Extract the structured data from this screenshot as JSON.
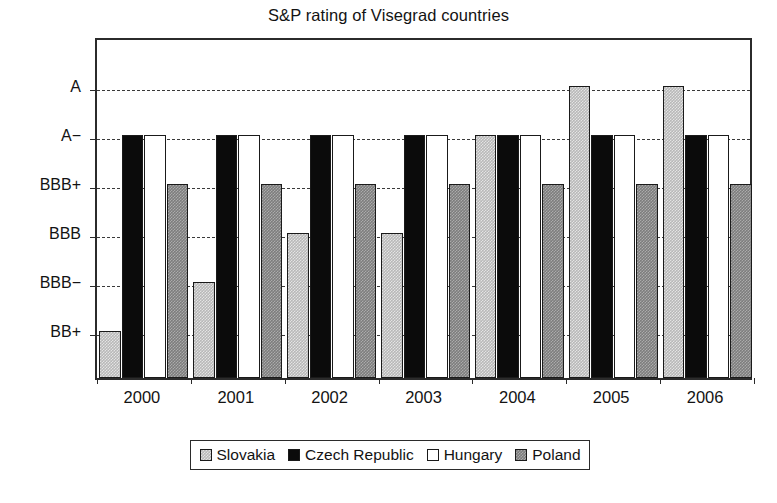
{
  "chart_data": {
    "type": "bar",
    "title": "S&P rating of Visegrad countries",
    "xlabel": "",
    "ylabel": "",
    "grid": true,
    "legend_position": "bottom",
    "categories": [
      "2000",
      "2001",
      "2002",
      "2003",
      "2004",
      "2005",
      "2006"
    ],
    "y_tick_labels": [
      "A",
      "A−",
      "BBB+",
      "BBB",
      "BBB−",
      "BB+"
    ],
    "y_scale_ordinal": [
      "BB+",
      "BBB−",
      "BBB",
      "BBB+",
      "A−",
      "A"
    ],
    "ylim": [
      0,
      6
    ],
    "series": [
      {
        "name": "Slovakia",
        "color": "#b8b8b8",
        "ratings": [
          "BB+",
          "BBB−",
          "BBB",
          "BBB",
          "A−",
          "A",
          "A"
        ],
        "values": [
          1,
          2,
          3,
          3,
          5,
          6,
          6
        ]
      },
      {
        "name": "Czech Republic",
        "color": "#0b0b0b",
        "ratings": [
          "A−",
          "A−",
          "A−",
          "A−",
          "A−",
          "A−",
          "A−"
        ],
        "values": [
          5,
          5,
          5,
          5,
          5,
          5,
          5
        ]
      },
      {
        "name": "Hungary",
        "color": "#ffffff",
        "ratings": [
          "A−",
          "A−",
          "A−",
          "A−",
          "A−",
          "A−",
          "A−"
        ],
        "values": [
          5,
          5,
          5,
          5,
          5,
          5,
          5
        ]
      },
      {
        "name": "Poland",
        "color": "#7d7d7d",
        "ratings": [
          "BBB+",
          "BBB+",
          "BBB+",
          "BBB+",
          "BBB+",
          "BBB+",
          "BBB+"
        ],
        "values": [
          4,
          4,
          4,
          4,
          4,
          4,
          4
        ]
      }
    ]
  },
  "legend": {
    "items": [
      {
        "label": "Slovakia",
        "swatch": "slovakia"
      },
      {
        "label": "Czech Republic",
        "swatch": "czech"
      },
      {
        "label": "Hungary",
        "swatch": "hungary"
      },
      {
        "label": "Poland",
        "swatch": "poland"
      }
    ]
  }
}
